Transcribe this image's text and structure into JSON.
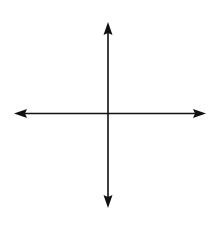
{
  "diagram": {
    "type": "coordinate-axes",
    "colors": {
      "background": "#ffffff",
      "axis": "#111111"
    },
    "origin": {
      "x": 108,
      "y": 113.5
    },
    "x_axis": {
      "x1": 14,
      "x2": 206,
      "y": 113.5,
      "arrows": [
        "left",
        "right"
      ]
    },
    "y_axis": {
      "x": 108,
      "y1": 22,
      "y2": 208,
      "arrows": [
        "up",
        "down"
      ]
    },
    "labels": []
  }
}
